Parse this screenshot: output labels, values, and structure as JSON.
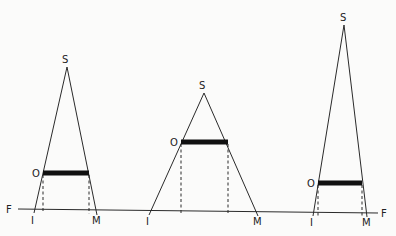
{
  "baseline": {
    "label": "F",
    "x1": 18,
    "y1": 209,
    "x2": 378,
    "y2": 213,
    "label_left": {
      "text": "F",
      "x": 6,
      "y": 213
    },
    "label_right": {
      "text": "F",
      "x": 381,
      "y": 217
    }
  },
  "triangles": [
    {
      "name": "left",
      "apex": {
        "x": 67,
        "y": 67,
        "label": "S",
        "lx": 62,
        "ly": 63
      },
      "base_left": {
        "x": 34,
        "y": 209,
        "label": "I",
        "lx": 31,
        "ly": 224
      },
      "base_right": {
        "x": 97,
        "y": 211,
        "label": "M",
        "lx": 92,
        "ly": 224
      },
      "bar": {
        "x1": 43,
        "x2": 89,
        "y": 173,
        "label": "O",
        "lx": 32,
        "ly": 177
      }
    },
    {
      "name": "middle",
      "apex": {
        "x": 204,
        "y": 93,
        "label": "S",
        "lx": 199,
        "ly": 89
      },
      "base_left": {
        "x": 149,
        "y": 211,
        "label": "I",
        "lx": 146,
        "ly": 225
      },
      "base_right": {
        "x": 258,
        "y": 212,
        "label": "M",
        "lx": 253,
        "ly": 225
      },
      "bar": {
        "x1": 181,
        "x2": 228,
        "y": 142,
        "label": "O",
        "lx": 170,
        "ly": 146
      }
    },
    {
      "name": "right",
      "apex": {
        "x": 344,
        "y": 25,
        "label": "S",
        "lx": 340,
        "ly": 21
      },
      "base_left": {
        "x": 313,
        "y": 212,
        "label": "I",
        "lx": 310,
        "ly": 226
      },
      "base_right": {
        "x": 367,
        "y": 213,
        "label": "M",
        "lx": 362,
        "ly": 226
      },
      "bar": {
        "x1": 318,
        "x2": 362,
        "y": 183,
        "label": "O",
        "lx": 307,
        "ly": 187
      }
    }
  ]
}
